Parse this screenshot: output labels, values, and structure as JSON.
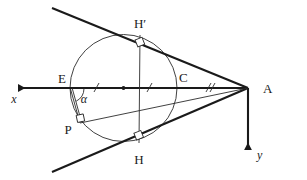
{
  "figure": {
    "type": "geometry-diagram",
    "background_color": "#ffffff",
    "line_color": "#1a1a1a",
    "thin_line_color": "#2b2b2b"
  },
  "labels": {
    "point_a": "A",
    "point_c": "C",
    "point_e": "E",
    "point_p": "P",
    "point_h": "H",
    "point_h_prime": "H′",
    "angle_alpha": "α",
    "axis_x": "x",
    "axis_y": "y"
  },
  "geometry": {
    "circle": {
      "cx": 123.5,
      "cy": 88,
      "r": 53.5
    },
    "points": {
      "A": {
        "x": 248,
        "y": 88
      },
      "C": {
        "x": 177,
        "y": 88
      },
      "E": {
        "x": 70,
        "y": 88
      },
      "center": {
        "x": 123.5,
        "y": 88
      },
      "P": {
        "x": 80,
        "y": 123
      },
      "H": {
        "x": 139,
        "y": 143
      },
      "H_prime": {
        "x": 140,
        "y": 35
      }
    },
    "tangent_upper": {
      "x1": 52,
      "y1": 8,
      "x2": 248,
      "y2": 88
    },
    "tangent_lower": {
      "x1": 52,
      "y1": 172,
      "x2": 248,
      "y2": 88
    },
    "axis_x_line": {
      "x1": 12,
      "y1": 88,
      "x2": 248,
      "y2": 88
    },
    "axis_y_line": {
      "x1": 248,
      "y1": 88,
      "x2": 248,
      "y2": 156
    },
    "chord_h_hprime": {
      "x1": 140,
      "y1": 35,
      "x2": 139,
      "y2": 143
    },
    "segment_p_to_a": {
      "x1": 80,
      "y1": 123,
      "x2": 248,
      "y2": 88
    },
    "segment_e_to_p": {
      "x1": 70,
      "y1": 88,
      "x2": 80,
      "y2": 123
    }
  },
  "tick_marks": {
    "segment_e_center": {
      "count": 1,
      "meaning": "radius"
    },
    "segment_center_c": {
      "count": 1,
      "meaning": "radius"
    },
    "segment_c_a": {
      "count": 2,
      "meaning": "equal-length-marker"
    }
  },
  "right_angle_markers": [
    {
      "at": "H_prime",
      "meaning": "chord perpendicular to upper tangent"
    },
    {
      "at": "H",
      "meaning": "chord perpendicular to lower tangent"
    },
    {
      "at": "P",
      "meaning": "perpendicular at P"
    }
  ],
  "angles": [
    {
      "name": "alpha",
      "vertex": "E",
      "between": "x-axis and chord EP"
    }
  ]
}
